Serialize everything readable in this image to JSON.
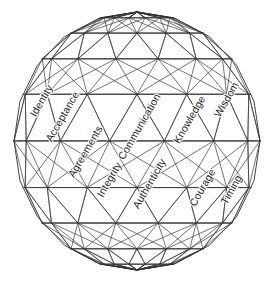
{
  "diagram": {
    "type": "geodesic-sphere-wireframe",
    "background_color": "#ffffff",
    "line_color": "#3a3a3a",
    "text_color": "#1b1b1b",
    "geometry": {
      "center_x": 137,
      "center_y": 141,
      "radius_x": 123,
      "radius_y": 129,
      "bounds": {
        "left": 14,
        "top": 13,
        "right": 260,
        "bottom": 270
      },
      "latitude_bands": [
        13,
        45,
        78,
        117,
        163,
        210,
        243,
        270
      ],
      "meridian_count": 14
    },
    "labels": [
      {
        "id": "identity",
        "text": "Identity",
        "x": 42,
        "y": 101,
        "rotation": -60
      },
      {
        "id": "acceptance",
        "text": "Acceptance",
        "x": 63,
        "y": 117,
        "rotation": -60
      },
      {
        "id": "agreements",
        "text": "Agreements",
        "x": 86,
        "y": 152,
        "rotation": -60
      },
      {
        "id": "communication",
        "text": "Communication",
        "x": 140,
        "y": 127,
        "rotation": -60
      },
      {
        "id": "integrity",
        "text": "Integrity",
        "x": 110,
        "y": 180,
        "rotation": -60
      },
      {
        "id": "authenticity",
        "text": "Authenticity",
        "x": 150,
        "y": 184,
        "rotation": -60
      },
      {
        "id": "knowledge",
        "text": "Knowledge",
        "x": 190,
        "y": 120,
        "rotation": -60
      },
      {
        "id": "wisdom",
        "text": "Wisdom",
        "x": 227,
        "y": 100,
        "rotation": -60
      },
      {
        "id": "courage",
        "text": "Courage",
        "x": 203,
        "y": 188,
        "rotation": -60
      },
      {
        "id": "timing",
        "text": "Timing",
        "x": 232,
        "y": 190,
        "rotation": -60
      }
    ]
  }
}
